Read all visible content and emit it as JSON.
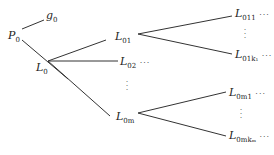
{
  "diagram": {
    "type": "tree",
    "nodes": {
      "P0": {
        "base": "P",
        "sub": "0"
      },
      "g0": {
        "base": "g",
        "sub": "0"
      },
      "L0": {
        "base": "L",
        "sub": "0"
      },
      "L01": {
        "base": "L",
        "sub": "01"
      },
      "L02": {
        "base": "L",
        "sub": "02",
        "trail": "···"
      },
      "L0m": {
        "base": "L",
        "sub": "0m"
      },
      "L011": {
        "base": "L",
        "sub": "011",
        "trail": "···"
      },
      "L01k1": {
        "base": "L",
        "sub": "01k₁",
        "trail": "···"
      },
      "L0m1": {
        "base": "L",
        "sub": "0m1",
        "trail": "···"
      },
      "L0mkm": {
        "base": "L",
        "sub": "0mkₘ",
        "trail": "···"
      }
    },
    "vdots": "⋮",
    "edges": [
      [
        "P0",
        "g0"
      ],
      [
        "P0",
        "L0"
      ],
      [
        "L0",
        "L01"
      ],
      [
        "L0",
        "L02"
      ],
      [
        "L0",
        "L0m"
      ],
      [
        "L01",
        "L011"
      ],
      [
        "L01",
        "L01k1"
      ],
      [
        "L0m",
        "L0m1"
      ],
      [
        "L0m",
        "L0mkm"
      ]
    ],
    "line_color": "#333333"
  }
}
